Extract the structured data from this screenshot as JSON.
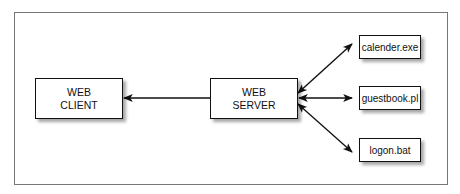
{
  "diagram": {
    "nodes": {
      "web_client": {
        "line1": "WEB",
        "line2": "CLIENT"
      },
      "web_server": {
        "line1": "WEB",
        "line2": "SERVER"
      },
      "calender": {
        "label": "calender.exe"
      },
      "guestbook": {
        "label": "guestbook.pl"
      },
      "logon": {
        "label": "logon.bat"
      }
    },
    "edges": [
      {
        "from": "web_server",
        "to": "web_client",
        "direction": "one-way"
      },
      {
        "from": "web_server",
        "to": "calender",
        "direction": "two-way"
      },
      {
        "from": "web_server",
        "to": "guestbook",
        "direction": "two-way"
      },
      {
        "from": "web_server",
        "to": "logon",
        "direction": "two-way"
      }
    ]
  }
}
